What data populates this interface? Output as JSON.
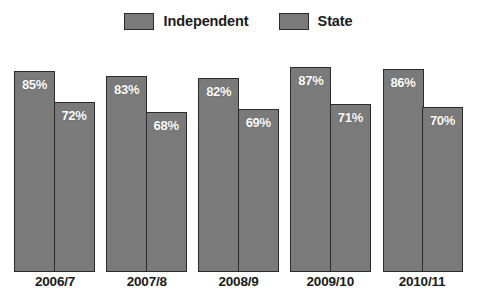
{
  "legend": {
    "position": "top-center",
    "entries": [
      {
        "label": "Independent",
        "swatch_name": "legend-swatch-independent",
        "color": "#7a7a7a"
      },
      {
        "label": "State",
        "swatch_name": "legend-swatch-state",
        "color": "#7a7a7a"
      }
    ]
  },
  "axis": {
    "categories": [
      "2006/7",
      "2007/8",
      "2008/9",
      "2009/10",
      "2010/11"
    ]
  },
  "chart_data": {
    "type": "bar",
    "title": "",
    "subtitle": "",
    "xlabel": "",
    "ylabel": "",
    "categories": [
      "2006/7",
      "2007/8",
      "2008/9",
      "2009/10",
      "2010/11"
    ],
    "series": [
      {
        "name": "Independent",
        "color": "#7a7a7a",
        "values": [
          85,
          83,
          82,
          87,
          86
        ],
        "labels": [
          "85%",
          "83%",
          "82%",
          "87%",
          "86%"
        ]
      },
      {
        "name": "State",
        "color": "#7a7a7a",
        "values": [
          72,
          68,
          69,
          71,
          70
        ],
        "labels": [
          "72%",
          "68%",
          "69%",
          "71%",
          "70%"
        ]
      }
    ],
    "ylim": [
      0,
      100
    ],
    "value_suffix": "%",
    "grid": false,
    "y_axis_visible": false,
    "legend_position": "top-center",
    "data_labels": true
  },
  "style": {
    "bar_fill": "#7a7a7a",
    "bar_border": "#2b2b2b",
    "label_text_color": "#ffffff",
    "axis_text_color": "#1a1a1a",
    "background": "#ffffff"
  }
}
